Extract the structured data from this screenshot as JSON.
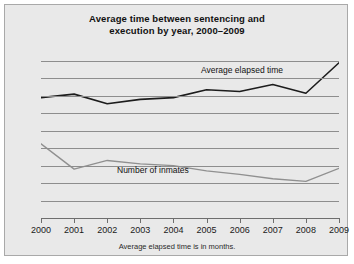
{
  "chart_data": {
    "type": "line",
    "title": "Average time between sentencing and execution by year, 2000–2009",
    "title_line1": "Average time between sentencing and",
    "title_line2": "execution by year, 2000–2009",
    "footnote": "Average elapsed time is in months.",
    "xlabel": "",
    "ylabel": "",
    "x": [
      2000,
      2001,
      2002,
      2003,
      2004,
      2005,
      2006,
      2007,
      2008,
      2009
    ],
    "categories": [
      "2000",
      "2001",
      "2002",
      "2003",
      "2004",
      "2005",
      "2006",
      "2007",
      "2008",
      "2009"
    ],
    "ylim": [
      0,
      180
    ],
    "yticks": [
      0,
      20,
      40,
      60,
      80,
      100,
      120,
      140,
      160,
      180
    ],
    "ytick_labels": [
      "0",
      "20",
      "40",
      "60",
      "80",
      "100",
      "120",
      "140",
      "160",
      "180"
    ],
    "grid": true,
    "legend": "inline-labels",
    "series": [
      {
        "name": "Average elapsed time",
        "color": "#1c1c1c",
        "width": 1.6,
        "values": [
          138,
          142,
          131,
          136,
          138,
          147,
          145,
          153,
          143,
          178
        ]
      },
      {
        "name": "Number of inmates",
        "color": "#909090",
        "width": 1.4,
        "values": [
          85,
          56,
          66,
          62,
          60,
          54,
          50,
          45,
          42,
          57
        ]
      }
    ],
    "annotations": [
      {
        "text": "Average elapsed time",
        "x": 2005.8,
        "y": 172
      },
      {
        "text": "Number of inmates",
        "x": 2002.6,
        "y": 67
      }
    ]
  },
  "style": {
    "background": "#e9e9e9",
    "page_background": "#ffffff",
    "border": "#a9a9a9",
    "grid_color": "#8d8d8d",
    "axis_color": "#6e6e6e",
    "text_color": "#1a1a1a"
  }
}
